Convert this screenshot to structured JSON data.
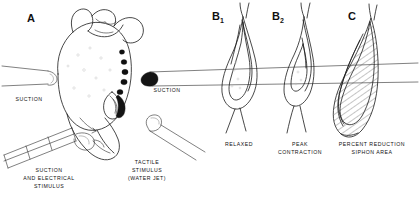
{
  "figure": {
    "background_color": "#ffffff",
    "ink_color": "#1a1a1a",
    "width": 420,
    "height": 198
  },
  "panels": {
    "a": {
      "letter": "A",
      "annotations": {
        "suction_left": "SUCTION",
        "suction_right": "SUCTION",
        "suction_electrical_line1": "SUCTION",
        "suction_electrical_line2": "AND ELECTRICAL",
        "suction_electrical_line3": "STIMULUS",
        "tactile_line1": "TACTILE",
        "tactile_line2": "STIMULUS",
        "tactile_line3": "(WATER JET)"
      }
    },
    "b1": {
      "letter": "B",
      "subscript": "1",
      "caption": "RELAXED"
    },
    "b2": {
      "letter": "B",
      "subscript": "2",
      "caption_line1": "PEAK",
      "caption_line2": "CONTRACTION"
    },
    "c": {
      "letter": "C",
      "caption_line1": "PERCENT REDUCTION",
      "caption_line2": "SIPHON AREA"
    }
  }
}
